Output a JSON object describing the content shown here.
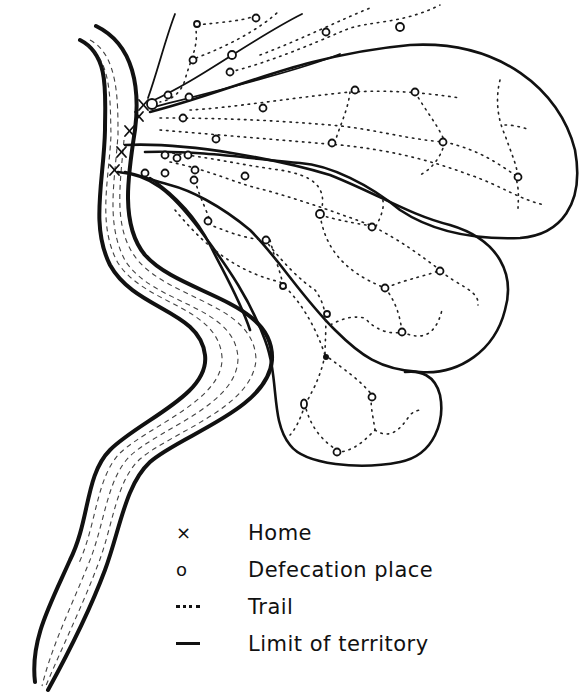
{
  "diagram": {
    "type": "territory-map",
    "colors": {
      "ink": "#111111",
      "background": "#ffffff"
    },
    "elements": {
      "river": {
        "label": "",
        "description": "Winding river with hatched water, running from top-left to bottom-left"
      },
      "homes": {
        "count": 5,
        "symbol": "x",
        "location": "along right bank of river, upper left"
      },
      "territories": {
        "count": 4,
        "description": "Elongated lobes fanning out to the right from the homes"
      }
    }
  },
  "legend": {
    "items": [
      {
        "symbol": "×",
        "symbol_name": "home-marker",
        "label": "Home"
      },
      {
        "symbol": "o",
        "symbol_name": "defecation-marker",
        "label": "Defecation place"
      },
      {
        "symbol": "---",
        "symbol_name": "trail-line",
        "label": "Trail"
      },
      {
        "symbol": "—",
        "symbol_name": "limit-line",
        "label": "Limit of territory"
      }
    ]
  }
}
